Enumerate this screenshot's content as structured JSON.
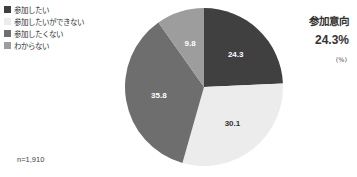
{
  "chart_data": {
    "type": "pie",
    "title": "参加意向",
    "highlight_value": "24.3%",
    "unit": "(%)",
    "sample_size": "n=1,910",
    "categories": [
      "参加したい",
      "参加したいができない",
      "参加したくない",
      "わからない"
    ],
    "values": [
      24.3,
      30.1,
      35.8,
      9.8
    ],
    "colors": [
      "#404040",
      "#ececec",
      "#6e6e6e",
      "#9d9d9d"
    ],
    "label_colors": [
      "#ffffff",
      "#333333",
      "#ffffff",
      "#ffffff"
    ],
    "start_angle": "12 o'clock",
    "direction": "clockwise",
    "legend_position": "top-left"
  },
  "legend": {
    "items": [
      {
        "label": "参加したい",
        "color": "#404040"
      },
      {
        "label": "参加したいができない",
        "color": "#ececec"
      },
      {
        "label": "参加したくない",
        "color": "#6e6e6e"
      },
      {
        "label": "わからない",
        "color": "#9d9d9d"
      }
    ]
  },
  "side": {
    "title": "参加意向",
    "value": "24.3%",
    "unit": "(%)"
  },
  "footer": {
    "sample": "n=1,910"
  }
}
